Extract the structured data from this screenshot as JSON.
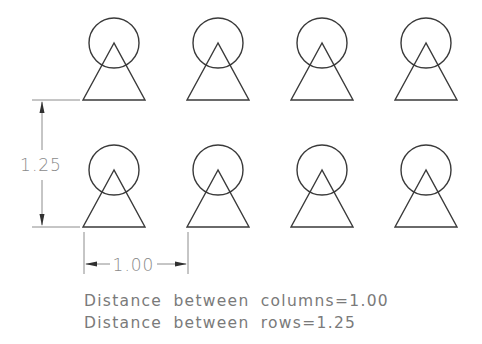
{
  "diagram": {
    "grid": {
      "rows": 2,
      "columns": 4,
      "column_x": [
        114,
        218,
        322,
        426
      ],
      "row_base_y": [
        100,
        227
      ]
    },
    "symbol": {
      "circle_radius": 25,
      "circle_center_offset_y": -57,
      "triangle_half_base": 31,
      "triangle_height": 57
    },
    "dimensions": {
      "row_spacing_label": "1.25",
      "column_spacing_label": "1.00"
    },
    "notes": {
      "line1": "Distance between columns=1.00",
      "line2": "Distance between rows=1.25"
    },
    "colors": {
      "shape_stroke": "#3a3a3a",
      "dimension_stroke": "#707070",
      "text": "#7a7a7a"
    }
  }
}
